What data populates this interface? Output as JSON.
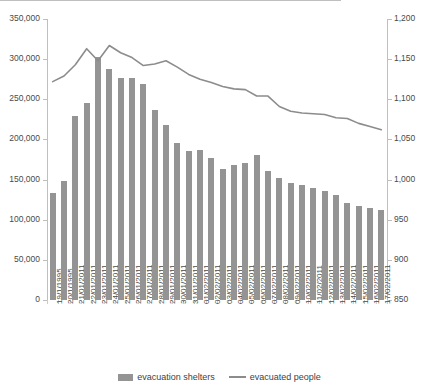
{
  "chart_data": {
    "type": "bar",
    "title": "",
    "xlabel": "",
    "ylabel": "",
    "grid": false,
    "legend_position": "bottom",
    "categories": [
      "19/1/1995",
      "20/1/1995",
      "21/01/2011",
      "22/01/2011",
      "23/01/2011",
      "24/01/2011",
      "25/01/2011",
      "26/01/2011",
      "27/01/2011",
      "28/01/2011",
      "29/01/2011",
      "30/01/2011",
      "31/01/2011",
      "01/02/2011",
      "02/02/2011",
      "03/02/2011",
      "04/02/2011",
      "05/02/2011",
      "06/02/2011",
      "07/02/2011",
      "08/02/2011",
      "09/02/2011",
      "10/02/2011",
      "11/02/2011",
      "12/02/2011",
      "13/02/2011",
      "14/02/2011",
      "15/02/2011",
      "16/02/2011",
      "17/02/2011"
    ],
    "series": [
      {
        "name": "evacuation shelters",
        "type": "bar",
        "axis": "left",
        "color": "#949494",
        "values": [
          133000,
          148000,
          229000,
          246000,
          303000,
          288000,
          277000,
          277000,
          269000,
          237000,
          218000,
          195000,
          185000,
          187000,
          177000,
          163000,
          168000,
          171000,
          181000,
          161000,
          152000,
          146000,
          143000,
          140000,
          136000,
          131000,
          121000,
          117000,
          114000,
          112000
        ]
      },
      {
        "name": "evacuated people",
        "type": "line",
        "axis": "right",
        "color": "#8c8c8c",
        "values": [
          1122,
          1129,
          1143,
          1163,
          1148,
          1167,
          1158,
          1152,
          1142,
          1144,
          1148,
          1140,
          1131,
          1125,
          1121,
          1116,
          1113,
          1112,
          1104,
          1104,
          1091,
          1085,
          1083,
          1082,
          1081,
          1077,
          1076,
          1070,
          1066,
          1062
        ]
      }
    ],
    "y_axis_left": {
      "min": 0,
      "max": 350000,
      "step": 50000,
      "ticks": [
        "0",
        "50,000",
        "100,000",
        "150,000",
        "200,000",
        "250,000",
        "300,000",
        "350,000"
      ]
    },
    "y_axis_right": {
      "min": 850,
      "max": 1200,
      "step": 50,
      "ticks": [
        "850",
        "900",
        "950",
        "1,000",
        "1,050",
        "1,100",
        "1,150",
        "1,200"
      ]
    }
  },
  "legend": {
    "items": [
      {
        "label": "evacuation shelters",
        "marker": "bar-swatch-icon"
      },
      {
        "label": "evacuated people",
        "marker": "line-swatch-icon"
      }
    ]
  }
}
